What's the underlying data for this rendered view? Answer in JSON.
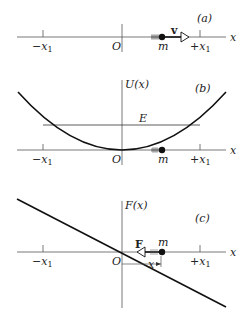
{
  "panels": [
    {
      "id": "a",
      "label": "(a)",
      "axis_label": "x",
      "origin_label": "O",
      "neg_tick": {
        "sign": "−",
        "var": "x",
        "sub": "1"
      },
      "pos_tick": {
        "sign": "+",
        "var": "x",
        "sub": "1"
      },
      "mass_label": "m",
      "velocity_label": "v"
    },
    {
      "id": "b",
      "label": "(b)",
      "axis_label": "x",
      "y_axis_label": "U(x)",
      "energy_label": "E",
      "origin_label": "O",
      "neg_tick": {
        "sign": "−",
        "var": "x",
        "sub": "1"
      },
      "pos_tick": {
        "sign": "+",
        "var": "x",
        "sub": "1"
      },
      "mass_label": "m"
    },
    {
      "id": "c",
      "label": "(c)",
      "axis_label": "x",
      "y_axis_label": "F(x)",
      "force_label": "F",
      "origin_label": "O",
      "displacement_label": "x",
      "neg_tick": {
        "sign": "−",
        "var": "x",
        "sub": "1"
      },
      "pos_tick": {
        "sign": "+",
        "var": "x",
        "sub": "1"
      },
      "mass_label": "m"
    }
  ],
  "colors": {
    "ink": "#1a1a1a",
    "axis": "#555555"
  }
}
